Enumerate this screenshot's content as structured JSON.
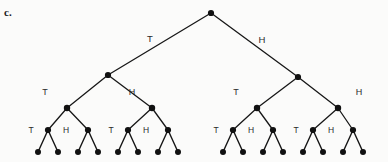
{
  "figure": {
    "part_label": "c.",
    "type": "probability-tree",
    "levels": 4,
    "leaf_count": 16,
    "outcomes": [
      "T",
      "H"
    ]
  },
  "chart_data": {
    "type": "diagram",
    "title": "",
    "subtitle": "",
    "xlabel": "",
    "ylabel": "",
    "structure": "binary-tree",
    "depth": 4,
    "branch_labels": [
      "T",
      "H"
    ],
    "levels": [
      {
        "level": 0,
        "node_count": 1,
        "y": 13,
        "nodes": [
          {
            "id": "root",
            "x": 211,
            "y": 13,
            "label": ""
          }
        ]
      },
      {
        "level": 1,
        "node_count": 2,
        "y": 76,
        "edge_label_y": 40,
        "nodes": [
          {
            "id": "T",
            "x": 108,
            "y": 75,
            "label": "T",
            "label_x": 150,
            "label_y": 39
          },
          {
            "id": "H",
            "x": 298,
            "y": 77,
            "label": "H",
            "label_x": 262,
            "label_y": 40
          }
        ]
      },
      {
        "level": 2,
        "node_count": 4,
        "y": 108,
        "edge_label_y": 93,
        "nodes": [
          {
            "id": "TT",
            "x": 67,
            "y": 108,
            "label": "T",
            "label_x": 45,
            "label_y": 93
          },
          {
            "id": "TH",
            "x": 152,
            "y": 108,
            "label": "H",
            "label_x": 132,
            "label_y": 93
          },
          {
            "id": "HT",
            "x": 257,
            "y": 108,
            "label": "T",
            "label_x": 236,
            "label_y": 93
          },
          {
            "id": "HH",
            "x": 338,
            "y": 108,
            "label": "H",
            "label_x": 359,
            "label_y": 93
          }
        ]
      },
      {
        "level": 3,
        "node_count": 8,
        "y": 130,
        "edge_label_y": 130,
        "nodes": [
          {
            "id": "TTT",
            "x": 48,
            "y": 130,
            "label": "T",
            "label_x": 31,
            "label_y": 131
          },
          {
            "id": "TTH",
            "x": 88,
            "y": 130,
            "label": "H",
            "label_x": 66,
            "label_y": 131
          },
          {
            "id": "THT",
            "x": 128,
            "y": 130,
            "label": "T",
            "label_x": 111,
            "label_y": 131
          },
          {
            "id": "THH",
            "x": 168,
            "y": 130,
            "label": "H",
            "label_x": 146,
            "label_y": 131
          },
          {
            "id": "HTT",
            "x": 233,
            "y": 130,
            "label": "T",
            "label_x": 216,
            "label_y": 131
          },
          {
            "id": "HTH",
            "x": 273,
            "y": 130,
            "label": "H",
            "label_x": 251,
            "label_y": 131
          },
          {
            "id": "HHT",
            "x": 313,
            "y": 130,
            "label": "T",
            "label_x": 296,
            "label_y": 131
          },
          {
            "id": "HHH",
            "x": 353,
            "y": 130,
            "label": "H",
            "label_x": 331,
            "label_y": 131
          }
        ]
      },
      {
        "level": 4,
        "node_count": 16,
        "y": 152,
        "nodes": [
          {
            "id": "L1",
            "x": 38,
            "y": 152
          },
          {
            "id": "L2",
            "x": 58,
            "y": 152
          },
          {
            "id": "L3",
            "x": 78,
            "y": 152
          },
          {
            "id": "L4",
            "x": 98,
            "y": 152
          },
          {
            "id": "L5",
            "x": 118,
            "y": 152
          },
          {
            "id": "L6",
            "x": 138,
            "y": 152
          },
          {
            "id": "L7",
            "x": 158,
            "y": 152
          },
          {
            "id": "L8",
            "x": 178,
            "y": 152
          },
          {
            "id": "L9",
            "x": 223,
            "y": 152
          },
          {
            "id": "L10",
            "x": 243,
            "y": 152
          },
          {
            "id": "L11",
            "x": 263,
            "y": 152
          },
          {
            "id": "L12",
            "x": 283,
            "y": 152
          },
          {
            "id": "L13",
            "x": 303,
            "y": 152
          },
          {
            "id": "L14",
            "x": 323,
            "y": 152
          },
          {
            "id": "L15",
            "x": 343,
            "y": 152
          },
          {
            "id": "L16",
            "x": 363,
            "y": 152
          }
        ]
      }
    ],
    "edges": [
      {
        "from": "root",
        "to": "T",
        "label": "T"
      },
      {
        "from": "root",
        "to": "H",
        "label": "H"
      },
      {
        "from": "T",
        "to": "TT",
        "label": "T"
      },
      {
        "from": "T",
        "to": "TH",
        "label": "H"
      },
      {
        "from": "H",
        "to": "HT",
        "label": "T"
      },
      {
        "from": "H",
        "to": "HH",
        "label": "H"
      },
      {
        "from": "TT",
        "to": "TTT",
        "label": "T"
      },
      {
        "from": "TT",
        "to": "TTH",
        "label": "H"
      },
      {
        "from": "TH",
        "to": "THT",
        "label": "T"
      },
      {
        "from": "TH",
        "to": "THH",
        "label": "H"
      },
      {
        "from": "HT",
        "to": "HTT",
        "label": "T"
      },
      {
        "from": "HT",
        "to": "HTH",
        "label": "H"
      },
      {
        "from": "HH",
        "to": "HHT",
        "label": "T"
      },
      {
        "from": "HH",
        "to": "HHH",
        "label": "H"
      },
      {
        "from": "TTT",
        "to": "L1"
      },
      {
        "from": "TTT",
        "to": "L2"
      },
      {
        "from": "TTH",
        "to": "L3"
      },
      {
        "from": "TTH",
        "to": "L4"
      },
      {
        "from": "THT",
        "to": "L5"
      },
      {
        "from": "THT",
        "to": "L6"
      },
      {
        "from": "THH",
        "to": "L7"
      },
      {
        "from": "THH",
        "to": "L8"
      },
      {
        "from": "HTT",
        "to": "L9"
      },
      {
        "from": "HTT",
        "to": "L10"
      },
      {
        "from": "HTH",
        "to": "L11"
      },
      {
        "from": "HTH",
        "to": "L12"
      },
      {
        "from": "HHT",
        "to": "L13"
      },
      {
        "from": "HHT",
        "to": "L14"
      },
      {
        "from": "HHH",
        "to": "L15"
      },
      {
        "from": "HHH",
        "to": "L16"
      }
    ],
    "style": {
      "line_color": "#171717",
      "node_color": "#111111",
      "label_color": "#2a2a2a",
      "background": "#fbfbfa"
    }
  }
}
